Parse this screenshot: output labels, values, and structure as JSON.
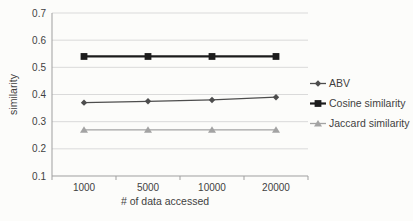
{
  "chart_data": {
    "type": "line",
    "xlabel": "# of data accessed",
    "ylabel": "similarity",
    "categories": [
      "1000",
      "5000",
      "10000",
      "20000"
    ],
    "y_ticks": [
      0.1,
      0.2,
      0.3,
      0.4,
      0.5,
      0.6,
      0.7
    ],
    "ylim": [
      0.1,
      0.7
    ],
    "grid": "horizontal-only",
    "legend_position": "right",
    "series": [
      {
        "name": "ABV",
        "marker": "diamond",
        "color": "#4d4d4d",
        "line_width": 1.3,
        "values": [
          0.37,
          0.375,
          0.38,
          0.39
        ]
      },
      {
        "name": "Cosine similarity",
        "marker": "square",
        "color": "#1c1c1c",
        "line_width": 2.2,
        "values": [
          0.54,
          0.54,
          0.54,
          0.54
        ]
      },
      {
        "name": "Jaccard similarity",
        "marker": "triangle",
        "color": "#a3a3a3",
        "line_width": 1.3,
        "values": [
          0.27,
          0.27,
          0.27,
          0.27
        ]
      }
    ],
    "colors": {
      "background": "#fcfcfa",
      "gridline": "#dadada",
      "axis": "#9f9f9f",
      "text": "#3f3f3f"
    }
  }
}
